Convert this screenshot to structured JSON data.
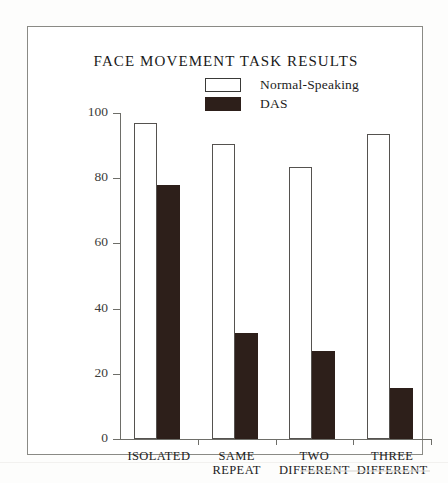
{
  "figure": {
    "title": "FACE MOVEMENT TASK RESULTS"
  },
  "legend": {
    "position": "top-center-right",
    "entries": [
      {
        "label": "Normal-Speaking",
        "swatch": "white-outlined",
        "color": "#ffffff"
      },
      {
        "label": "DAS",
        "swatch": "dark-filled",
        "color": "#2d1f1a"
      }
    ]
  },
  "axes": {
    "y_title": "MEAN PERCENT CORRECT RESPONSE",
    "y_ticks": [
      "0",
      "20",
      "40",
      "60",
      "80",
      "100"
    ],
    "x_labels": [
      {
        "line1": "ISOLATED",
        "line2": ""
      },
      {
        "line1": "SAME",
        "line2": "REPEAT"
      },
      {
        "line1": "TWO",
        "line2": "DIFFERENT"
      },
      {
        "line1": "THREE",
        "line2": "DIFFERENT"
      }
    ]
  },
  "chart_data": {
    "type": "bar",
    "title": "FACE MOVEMENT TASK RESULTS",
    "xlabel": "",
    "ylabel": "MEAN PERCENT CORRECT RESPONSE",
    "ylim": [
      0,
      100
    ],
    "yticks": [
      0,
      20,
      40,
      60,
      80,
      100
    ],
    "grid": false,
    "legend_position": "top-center",
    "categories": [
      "ISOLATED",
      "SAME REPEAT",
      "TWO DIFFERENT",
      "THREE DIFFERENT"
    ],
    "series": [
      {
        "name": "Normal-Speaking",
        "color": "#ffffff",
        "values": [
          97,
          90.5,
          83.5,
          93.5
        ]
      },
      {
        "name": "DAS",
        "color": "#2d1f1a",
        "values": [
          78,
          32.5,
          27,
          15.5
        ]
      }
    ]
  }
}
